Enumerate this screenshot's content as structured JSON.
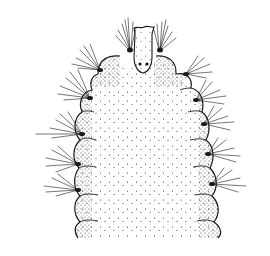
{
  "figure": {
    "subject": "stippled scientific illustration of the anterior end of a polychaete worm, dorsal view",
    "colors": {
      "ink": "#1a1a1a",
      "background": "#ffffff"
    },
    "parts": {
      "prostomium": "narrow median prostomium with two eye spots",
      "peristomium_lobes": "two rounded lobes flanking the prostomium, each with a chaetal tuft",
      "segments": 6,
      "parapodia_left": 5,
      "parapodia_right": 6
    }
  }
}
